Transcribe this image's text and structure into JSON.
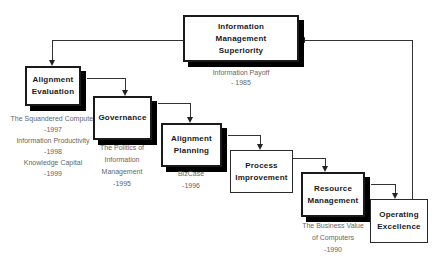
{
  "colors": {
    "background": "#ffffff",
    "box_fill": "#ffffff",
    "box_border": "#1a1a1a",
    "box_shadow": "#000000",
    "connector": "#333333",
    "title_text": "#1a1a1a",
    "subtitle_text": "#666666"
  },
  "nodes": [
    {
      "id": "information-management-superiority",
      "title": "Information\nManagement\nSuperiority",
      "subtitle": "Information Payoff\n- 1985"
    },
    {
      "id": "alignment-evaluation",
      "title": "Alignment\nEvaluation",
      "subtitle": "The Squandered Computer\n-1997\nInformation Productivity\n-1998\nKnowledge Capital\n-1999"
    },
    {
      "id": "governance",
      "title": "Governance",
      "subtitle": "The Politics of\nInformation\nManagement\n-1995"
    },
    {
      "id": "alignment-planning",
      "title": "Alignment\nPlanning",
      "subtitle": "BizCase\n-1996"
    },
    {
      "id": "process-improvement",
      "title": "Process\nImprovement",
      "subtitle": ""
    },
    {
      "id": "resource-management",
      "title": "Resource\nManagement",
      "subtitle": "The Business Value\nof Computers\n-1990"
    },
    {
      "id": "operating-excellence",
      "title": "Operating\nExcellence",
      "subtitle": ""
    }
  ],
  "connectors": [
    {
      "from": "information-management-superiority",
      "to": "alignment-evaluation"
    },
    {
      "from": "alignment-evaluation",
      "to": "governance"
    },
    {
      "from": "governance",
      "to": "alignment-planning"
    },
    {
      "from": "alignment-planning",
      "to": "process-improvement"
    },
    {
      "from": "process-improvement",
      "to": "resource-management"
    },
    {
      "from": "resource-management",
      "to": "operating-excellence"
    },
    {
      "from": "operating-excellence",
      "to": "information-management-superiority"
    }
  ]
}
